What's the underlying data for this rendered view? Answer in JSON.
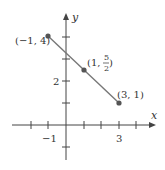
{
  "diagram": {
    "axes": {
      "x_label": "x",
      "y_label": "y",
      "x_tick_labels": [
        {
          "value": -1,
          "text": "−1"
        },
        {
          "value": 3,
          "text": "3"
        }
      ],
      "y_tick_labels": [
        {
          "value": 2,
          "text": "2"
        }
      ],
      "x_ticks": [
        -2,
        -1,
        1,
        2,
        3,
        4
      ],
      "y_ticks": [
        -1,
        1,
        2,
        3,
        4
      ]
    },
    "points": [
      {
        "x": -1,
        "y": 4,
        "label": "(−1, 4)"
      },
      {
        "x": 1,
        "y": 2.5,
        "label_prefix": "(1, ",
        "frac_num": "5",
        "frac_den": "2",
        "label_suffix": ")"
      },
      {
        "x": 3,
        "y": 1,
        "label": "(3, 1)"
      }
    ],
    "segment": {
      "from": [
        -1,
        4
      ],
      "to": [
        3,
        1
      ]
    },
    "colors": {
      "axis": "#444444",
      "segment": "#777777",
      "point": "#555555",
      "text": "#333333"
    }
  }
}
